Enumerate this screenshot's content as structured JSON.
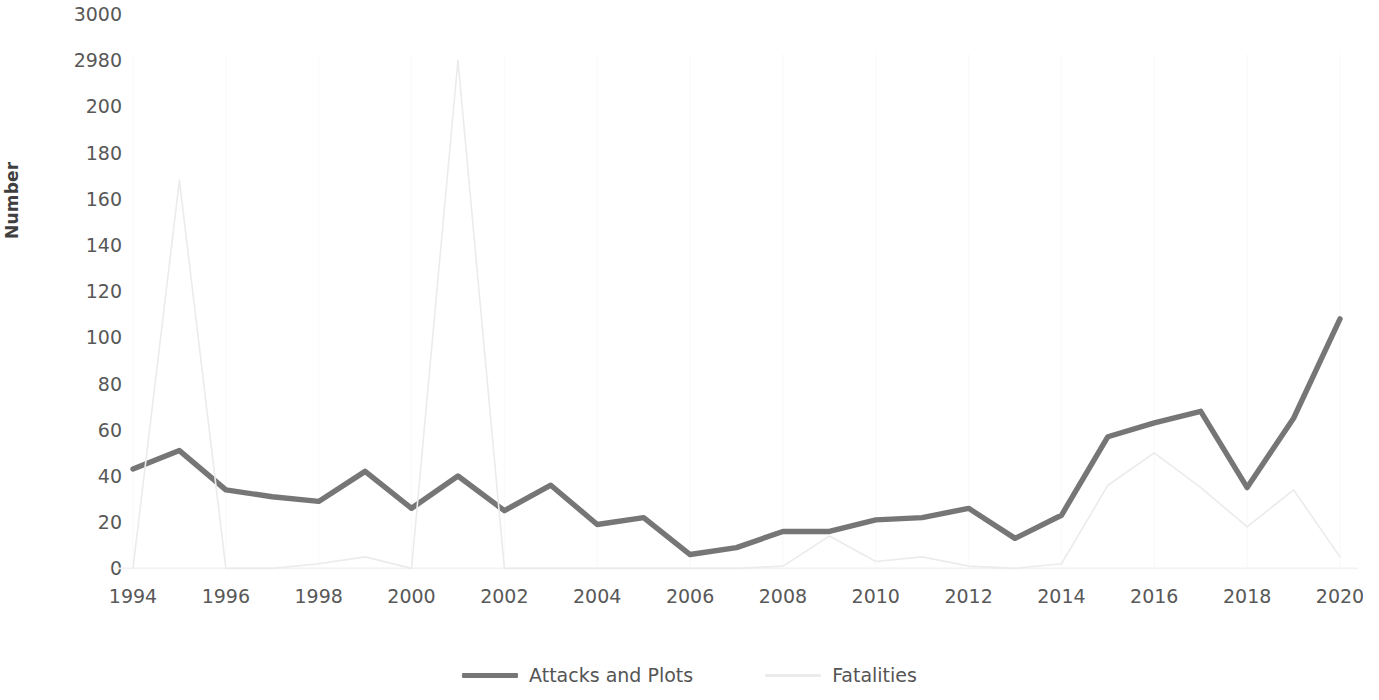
{
  "chart_data": {
    "type": "line",
    "title": "",
    "xlabel": "",
    "ylabel": "Number",
    "x": [
      1994,
      1995,
      1996,
      1997,
      1998,
      1999,
      2000,
      2001,
      2002,
      2003,
      2004,
      2005,
      2006,
      2007,
      2008,
      2009,
      2010,
      2011,
      2012,
      2013,
      2014,
      2015,
      2016,
      2017,
      2018,
      2019,
      2020
    ],
    "x_tick_labels": [
      "1994",
      "1996",
      "1998",
      "2000",
      "2002",
      "2004",
      "2006",
      "2008",
      "2010",
      "2012",
      "2014",
      "2016",
      "2018",
      "2020"
    ],
    "x_tick_values": [
      1994,
      1996,
      1998,
      2000,
      2002,
      2004,
      2006,
      2008,
      2010,
      2012,
      2014,
      2016,
      2018,
      2020
    ],
    "y_tick_labels": [
      "3000",
      "2980",
      "200",
      "180",
      "160",
      "140",
      "120",
      "100",
      "80",
      "60",
      "40",
      "20",
      "0"
    ],
    "y_tick_values": [
      3000,
      2980,
      200,
      180,
      160,
      140,
      120,
      100,
      80,
      60,
      40,
      20,
      0
    ],
    "y_axis_broken": true,
    "y_axis_break_note": "Axis is broken between 200 and 2980 to accommodate the 2001 fatalities value",
    "grid": false,
    "legend_position": "bottom",
    "series": [
      {
        "name": "Attacks and Plots",
        "color": "#767676",
        "values": [
          43,
          51,
          34,
          31,
          29,
          42,
          26,
          40,
          25,
          36,
          19,
          22,
          6,
          9,
          16,
          16,
          21,
          22,
          26,
          13,
          23,
          57,
          63,
          68,
          35,
          65,
          108
        ]
      },
      {
        "name": "Fatalities",
        "color": "#ebebeb",
        "values": [
          0,
          168,
          0,
          0,
          2,
          5,
          0,
          2980,
          0,
          0,
          0,
          0,
          0,
          0,
          1,
          14,
          3,
          5,
          1,
          0,
          2,
          36,
          50,
          35,
          18,
          34,
          5
        ]
      }
    ],
    "series_names": [
      "Attacks and Plots",
      "Fatalities"
    ]
  },
  "legend": {
    "items": [
      {
        "label": "Attacks and Plots",
        "color": "#767676"
      },
      {
        "label": "Fatalities",
        "color": "#ebebeb"
      }
    ]
  },
  "axes": {
    "y_title": "Number"
  }
}
